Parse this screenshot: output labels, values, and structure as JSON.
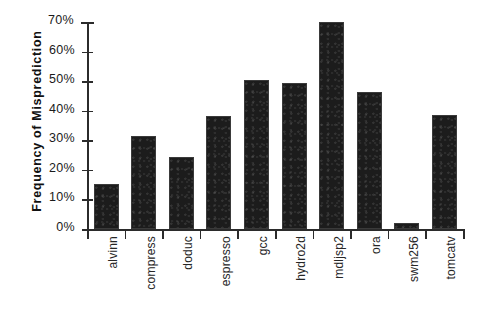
{
  "chart_data": {
    "type": "bar",
    "title": "",
    "xlabel": "",
    "ylabel": "Frequency of Misprediction",
    "ylim": [
      0,
      70
    ],
    "ytick_labels": [
      "70%",
      "60%",
      "50%",
      "40%",
      "30%",
      "20%",
      "10%",
      "0%"
    ],
    "ytick_values": [
      70,
      60,
      50,
      40,
      30,
      20,
      10,
      0
    ],
    "grid": false,
    "legend": null,
    "categories": [
      "alvinn",
      "compress",
      "doduc",
      "espresso",
      "gcc",
      "hydro2d",
      "mdljsp2",
      "ora",
      "swm256",
      "tomcatv"
    ],
    "values": [
      15.2,
      31.5,
      24.3,
      38.2,
      50.3,
      49.3,
      70.0,
      46.2,
      2.0,
      38.5
    ],
    "value_unit": "%",
    "bar_color": "#1c1c1c",
    "axis_color": "#2b2b2b",
    "background_color": "#ffffff"
  }
}
